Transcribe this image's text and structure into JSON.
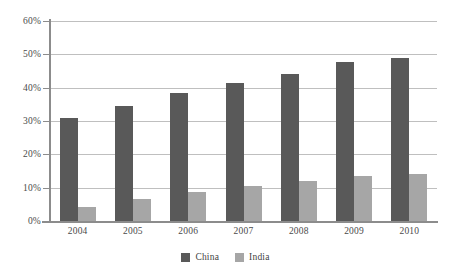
{
  "chart_data": {
    "type": "bar",
    "title": "",
    "subtitle": "",
    "xlabel": "",
    "ylabel": "",
    "categories": [
      "2004",
      "2005",
      "2006",
      "2007",
      "2008",
      "2009",
      "2010"
    ],
    "series": [
      {
        "name": "China",
        "color": "#595959",
        "values": [
          31.0,
          34.6,
          38.3,
          41.5,
          44.2,
          47.7,
          48.8
        ]
      },
      {
        "name": "India",
        "color": "#a6a6a6",
        "values": [
          4.2,
          6.5,
          8.7,
          10.5,
          12.0,
          13.4,
          14.1
        ]
      }
    ],
    "ylim": [
      0,
      60
    ],
    "ytick_values": [
      0,
      10,
      20,
      30,
      40,
      50,
      60
    ],
    "ytick_labels": [
      "0%",
      "10%",
      "20%",
      "30%",
      "40%",
      "50%",
      "60%"
    ],
    "grid": true,
    "grid_axis": "y",
    "legend": true,
    "legend_position": "bottom-center",
    "value_format": "percent"
  },
  "axes": {
    "y": {
      "ticks": [
        {
          "label": "60%",
          "value": 60
        },
        {
          "label": "50%",
          "value": 50
        },
        {
          "label": "40%",
          "value": 40
        },
        {
          "label": "30%",
          "value": 30
        },
        {
          "label": "20%",
          "value": 20
        },
        {
          "label": "10%",
          "value": 10
        },
        {
          "label": "0%",
          "value": 0
        }
      ]
    },
    "x": {
      "ticks": [
        {
          "label": "2004"
        },
        {
          "label": "2005"
        },
        {
          "label": "2006"
        },
        {
          "label": "2007"
        },
        {
          "label": "2008"
        },
        {
          "label": "2009"
        },
        {
          "label": "2010"
        }
      ]
    }
  },
  "legend": {
    "items": [
      {
        "label": "China",
        "color": "#595959"
      },
      {
        "label": "India",
        "color": "#a6a6a6"
      }
    ]
  },
  "colors": {
    "china": "#595959",
    "india": "#a6a6a6",
    "gridline": "#bfbfbf",
    "axis": "#8c8c8c",
    "text": "#3f3f3f",
    "background": "#ffffff"
  }
}
